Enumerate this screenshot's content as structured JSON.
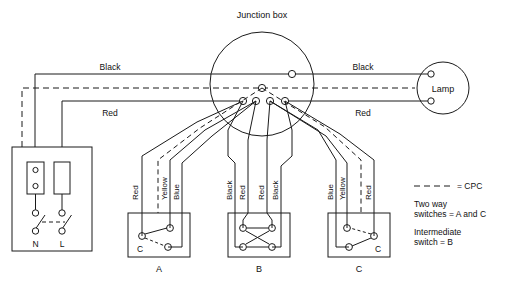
{
  "diagram": {
    "title_junction_box": "Junction box",
    "lamp_label": "Lamp",
    "supply": {
      "neutral_terminal": "N",
      "live_terminal": "L"
    },
    "main_run_labels": {
      "black_left": "Black",
      "red_left": "Red",
      "black_right": "Black",
      "red_right": "Red"
    },
    "switch_a": {
      "box_label": "A",
      "common_label": "C",
      "wires": [
        "Red",
        "Yellow",
        "Blue"
      ]
    },
    "switch_b": {
      "box_label": "B",
      "wires": [
        "Black",
        "Red",
        "Red",
        "Black"
      ]
    },
    "switch_c": {
      "box_label": "C",
      "common_label": "C",
      "wires": [
        "Blue",
        "Yellow",
        "Red"
      ]
    },
    "legend": {
      "cpc": "= CPC",
      "two_way_line1": "Two way",
      "two_way_line2": "switches = A and C",
      "intermediate_line1": "Intermediate",
      "intermediate_line2": "switch = B"
    },
    "colors": {
      "line": "#1a1a1a",
      "background": "#ffffff"
    }
  }
}
